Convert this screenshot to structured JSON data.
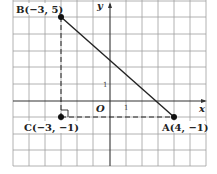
{
  "diagram": {
    "type": "coordinate-plane",
    "grid": {
      "xmin": -6,
      "xmax": 6,
      "ymin": -4,
      "ymax": 6,
      "unit_px_x": 16.1,
      "unit_px_y": 16.67
    },
    "axes": {
      "x_label": "x",
      "y_label": "y",
      "origin_label": "O",
      "x_tick": "1",
      "y_tick": "1"
    },
    "points": [
      {
        "name": "B",
        "x": -3,
        "y": 5,
        "label": "B(−3, 5)"
      },
      {
        "name": "C",
        "x": -3,
        "y": -1,
        "label": "C(−3, −1)"
      },
      {
        "name": "A",
        "x": 4,
        "y": -1,
        "label": "A(4, −1)"
      }
    ],
    "segments": [
      {
        "from": "B",
        "to": "A",
        "style": "solid"
      },
      {
        "from": "B",
        "to": "C",
        "style": "dashed"
      },
      {
        "from": "C",
        "to": "A",
        "style": "dashed"
      }
    ],
    "right_angle_at": "C",
    "colors": {
      "grid": "#9a9a9a",
      "line": "#222222",
      "background": "#ffffff"
    }
  }
}
